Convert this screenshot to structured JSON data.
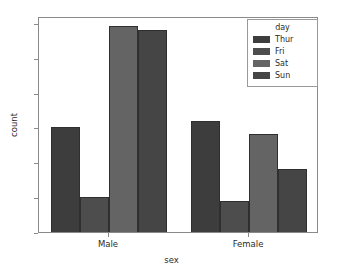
{
  "chart_data": {
    "type": "bar",
    "title": "",
    "subtitle": "",
    "xlabel": "sex",
    "ylabel": "count",
    "categories": [
      "Male",
      "Female"
    ],
    "series": [
      {
        "name": "Thur",
        "values": [
          30,
          32
        ],
        "color": "#3d3d3d"
      },
      {
        "name": "Fri",
        "values": [
          10,
          9
        ],
        "color": "#4d4d4d"
      },
      {
        "name": "Sat",
        "values": [
          59,
          28
        ],
        "color": "#646464"
      },
      {
        "name": "Sun",
        "values": [
          58,
          18
        ],
        "color": "#454545"
      }
    ],
    "ylim": [
      0,
      62
    ],
    "xlim": [
      0,
      2
    ],
    "yticks": [
      0,
      10,
      20,
      30,
      40,
      50,
      60
    ],
    "ytick_labels": [
      "0",
      "10",
      "20",
      "30",
      "40",
      "50",
      "60"
    ],
    "xtick_labels": [
      "Male",
      "Female"
    ],
    "grid": false,
    "legend": {
      "title": "day",
      "position": "upper right",
      "entries": [
        "Thur",
        "Fri",
        "Sat",
        "Sun"
      ]
    },
    "style": {
      "background": "#ffffff",
      "frame_color": "#8a8a8a",
      "text_color": "#2b2b2b",
      "bar_edge_color": "#2f2f2f"
    }
  }
}
